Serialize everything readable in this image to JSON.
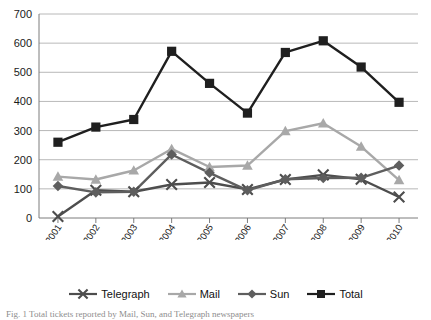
{
  "chart_data": {
    "type": "line",
    "title": "",
    "xlabel": "",
    "ylabel": "",
    "ylim": [
      0,
      700
    ],
    "ytick_step": 100,
    "yticks": [
      0,
      100,
      200,
      300,
      400,
      500,
      600,
      700
    ],
    "grid": true,
    "legend_position": "bottom",
    "categories": [
      "2000-2001",
      "2001-2002",
      "2002-2003",
      "2003-2004",
      "2004-2005",
      "2005-2006",
      "2006-2007",
      "2007-2008",
      "2008-2009",
      "2009-2010"
    ],
    "series": [
      {
        "name": "Telegraph",
        "marker": "x",
        "color": "#4d4d4d",
        "values": [
          5,
          95,
          90,
          115,
          122,
          98,
          132,
          148,
          133,
          72
        ]
      },
      {
        "name": "Mail",
        "marker": "triangle",
        "color": "#a8a8a8",
        "values": [
          142,
          132,
          163,
          237,
          175,
          180,
          298,
          325,
          245,
          130
        ]
      },
      {
        "name": "Sun",
        "marker": "diamond",
        "color": "#5e5e5e",
        "values": [
          110,
          88,
          90,
          218,
          155,
          95,
          133,
          137,
          138,
          180
        ]
      },
      {
        "name": "Total",
        "marker": "square",
        "color": "#1f1f1f",
        "values": [
          260,
          312,
          338,
          572,
          462,
          360,
          568,
          608,
          518,
          397
        ]
      }
    ]
  },
  "legend": {
    "items": [
      {
        "label": "Telegraph"
      },
      {
        "label": "Mail"
      },
      {
        "label": "Sun"
      },
      {
        "label": "Total"
      }
    ]
  },
  "caption": {
    "text": "Fig. 1 Total tickets reported by Mail, Sun, and Telegraph newspapers"
  }
}
